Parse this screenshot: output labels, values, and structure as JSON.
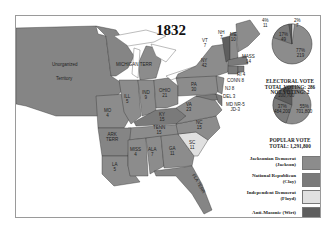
{
  "title": "1832",
  "colors": {
    "jackson": "#8c8c8c",
    "clay": "#7a7a7a",
    "floyd": "#e0e0e0",
    "wirt": "#5e5e5e",
    "territories": "#858585",
    "water": "#ffffff"
  },
  "map_labels": {
    "unorganized": "Unorganized",
    "territory": "Territory",
    "michigan_terr": "MICHIGAN TERR",
    "ill": "ILL\n5",
    "ind": "IND\n9",
    "ohio": "OHIO\n21",
    "pa": "PA\n30",
    "ny": "NY\n42",
    "vt": "VT\n7",
    "nh": "NH\n7",
    "me": "ME\n10",
    "mass": "MASS\n14",
    "ri": "RI 4",
    "conn": "CONN 8",
    "nj": "NJ 8",
    "del": "DEL 3",
    "md": "MD NR-5\nJD-3",
    "va": "VA\n23",
    "ky": "KY\n15",
    "mo": "MO\n4",
    "tenn": "TENN\n15",
    "nc": "NC\n15",
    "sc": "SC\n11",
    "ark": "ARK\nTERR",
    "miss": "MISS\n4",
    "ala": "ALA\n7",
    "ga": "GA\n11",
    "la": "LA\n5",
    "fla": "FLA TERR"
  },
  "electoral_vote": {
    "title": "ELECTORAL VOTE",
    "total_voting": "TOTAL VOTING: 286",
    "not_voting": "NOT VOTING: 2",
    "slices": [
      {
        "party": "Jackson",
        "pct": "77%",
        "votes": "219",
        "value": 77
      },
      {
        "party": "Clay",
        "pct": "17%",
        "votes": "49",
        "value": 17
      },
      {
        "party": "Wirt",
        "pct": "4%",
        "votes": "11",
        "value": 4
      },
      {
        "party": "Floyd",
        "pct": "2%",
        "votes": "7",
        "value": 2
      }
    ]
  },
  "popular_vote": {
    "title": "POPULAR VOTE",
    "total": "TOTAL: 1,291,800",
    "slices": [
      {
        "party": "Jackson",
        "pct": "55%",
        "votes": "701,800",
        "value": 55
      },
      {
        "party": "Clay",
        "pct": "37%",
        "votes": "484,200",
        "value": 37
      },
      {
        "party": "Wirt",
        "pct": "8%",
        "votes": "100,700",
        "value": 8
      }
    ]
  },
  "legend": [
    {
      "label": "Jacksonian Democrat\n(Jackson)",
      "key": "jackson"
    },
    {
      "label": "National Republican\n(Clay)",
      "key": "clay"
    },
    {
      "label": "Independent Democrat\n(Floyd)",
      "key": "floyd"
    },
    {
      "label": "Anti-Masonic (Wirt)",
      "key": "wirt"
    },
    {
      "label": "Territories",
      "key": "territories"
    }
  ]
}
